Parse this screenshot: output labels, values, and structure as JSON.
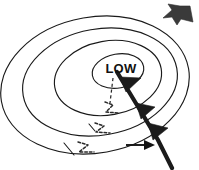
{
  "diagram": {
    "type": "weather-map",
    "background_color": "#ffffff",
    "center_label": "LOW",
    "isobar_color": "#1a1a1a",
    "front_color": "#1b1b1b",
    "flag_color": "#3a3a3a",
    "isobars": [
      {
        "name": "isobar-1-innermost",
        "cx": 118,
        "cy": 71,
        "rx": 26,
        "ry": 17,
        "rotation": -10
      },
      {
        "name": "isobar-2",
        "cx": 108,
        "cy": 78,
        "rx": 54,
        "ry": 37,
        "rotation": -10
      },
      {
        "name": "isobar-3",
        "cx": 100,
        "cy": 82,
        "rx": 78,
        "ry": 53,
        "rotation": -10
      },
      {
        "name": "isobar-4-outermost",
        "cx": 95,
        "cy": 85,
        "rx": 95,
        "ry": 68,
        "rotation": -10
      }
    ],
    "cold_front": {
      "name": "cold-front",
      "description": "thick line with solid triangular barbs running from low center to lower right",
      "barb_count": 3,
      "barb_direction": "right",
      "start": [
        118,
        73
      ],
      "end": [
        172,
        168
      ]
    },
    "trough": {
      "name": "trough-dashed-line",
      "description": "short dashed line descending from the low center"
    },
    "flow_arrows": [
      {
        "name": "flow-arrow-dashed-1",
        "style": "dashed",
        "label": ""
      },
      {
        "name": "flow-arrow-dashed-2",
        "style": "dashed",
        "label": ""
      },
      {
        "name": "flow-arrow-dashed-3",
        "style": "dashed",
        "label": ""
      },
      {
        "name": "flow-arrow-solid",
        "style": "solid",
        "label": ""
      }
    ],
    "corner_marker": {
      "name": "corner-flag-arrow",
      "position": "top-right",
      "color": "#3a3a3a"
    }
  }
}
